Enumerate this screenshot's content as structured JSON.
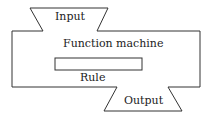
{
  "diagram": {
    "title": "Function machine",
    "input_label": "Input",
    "output_label": "Output",
    "rule_label": "Rule",
    "colors": {
      "stroke": "#333333",
      "text": "#222222",
      "background": "#ffffff"
    }
  }
}
